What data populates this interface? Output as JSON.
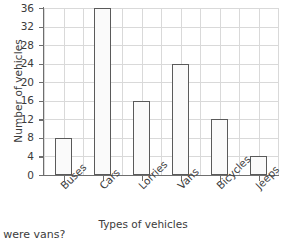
{
  "chart_data": {
    "type": "bar",
    "title": "",
    "categories": [
      "Buses",
      "Cars",
      "Lorries",
      "Vans",
      "Bicycles",
      "Jeeps"
    ],
    "values": [
      8,
      36,
      16,
      24,
      12,
      4
    ],
    "xlabel": "Types of vehicles",
    "ylabel": "Number of vehicles",
    "ylim": [
      0,
      36
    ],
    "ytick_labels": [
      "0",
      "4",
      "8",
      "12",
      "16",
      "20",
      "24",
      "28",
      "32",
      "36"
    ],
    "ytick_values": [
      0,
      4,
      8,
      12,
      16,
      20,
      24,
      28,
      32,
      36
    ],
    "grid": true,
    "legend": false,
    "bar_edge_color": "#5a5a5a",
    "bar_fill_color": "#fafafa",
    "grid_color": "#d9d9d9",
    "axis_color": "#6e6e6e"
  },
  "footer": {
    "note": "s were vans?"
  }
}
